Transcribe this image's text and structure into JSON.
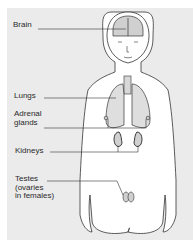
{
  "diagram": {
    "type": "anatomy",
    "colors": {
      "background": "#ebebeb",
      "line": "#333333",
      "organ_fill": "#d8d8d8",
      "body_fill": "#ffffff"
    },
    "labels": [
      {
        "id": "brain",
        "text": "Brain"
      },
      {
        "id": "lungs",
        "text": "Lungs"
      },
      {
        "id": "adrenal",
        "text": "Adrenal\nglands"
      },
      {
        "id": "kidneys",
        "text": "Kidneys"
      },
      {
        "id": "testes",
        "text": "Testes\n(ovaries\nin females)"
      }
    ]
  }
}
